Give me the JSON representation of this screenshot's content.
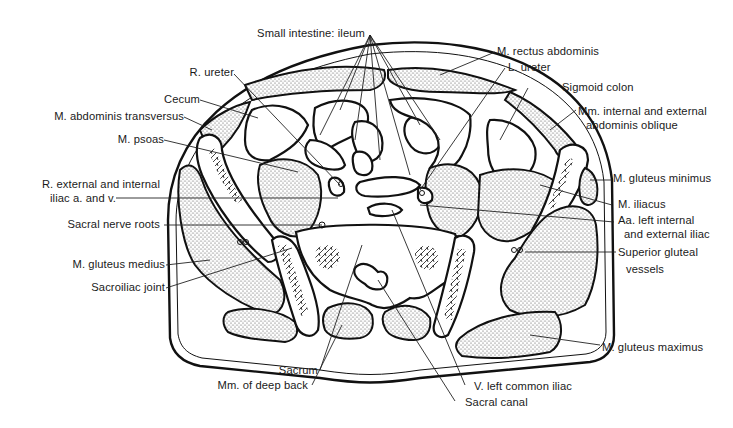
{
  "figure": {
    "type": "anatomical-cross-section",
    "colors": {
      "ink": "#111111",
      "background": "#ffffff",
      "stipple": "#8a8a8a"
    }
  },
  "labels": {
    "left": {
      "r_ureter": "R. ureter",
      "cecum": "Cecum",
      "abdominis_transversus": "M. abdominis transversus",
      "psoas": "M. psoas",
      "iliac_vessels_line1": "R. external and internal",
      "iliac_vessels_line2": "iliac a. and v.",
      "sacral_nerve_roots": "Sacral nerve roots",
      "gluteus_medius": "M. gluteus medius",
      "sacroiliac_joint": "Sacroiliac joint"
    },
    "top": {
      "small_intestine": "Small intestine: ileum"
    },
    "right": {
      "rectus_abdominis": "M. rectus abdominis",
      "l_ureter": "L. ureter",
      "sigmoid_colon": "Sigmoid colon",
      "obliques_line1": "Mm. internal and external",
      "obliques_line2": "abdominis oblique",
      "gluteus_minimus": "M. gluteus minimus",
      "iliacus": "M. iliacus",
      "left_iliac_arteries_line1": "Aa. left internal",
      "left_iliac_arteries_line2": "and external iliac",
      "superior_gluteal_line1": "Superior gluteal",
      "superior_gluteal_line2": "vessels",
      "gluteus_maximus": "M. gluteus maximus"
    },
    "bottom": {
      "sacrum": "Sacrum",
      "deep_back": "Mm. of deep back",
      "left_common_iliac_vein": "V. left common iliac",
      "sacral_canal": "Sacral canal"
    }
  }
}
